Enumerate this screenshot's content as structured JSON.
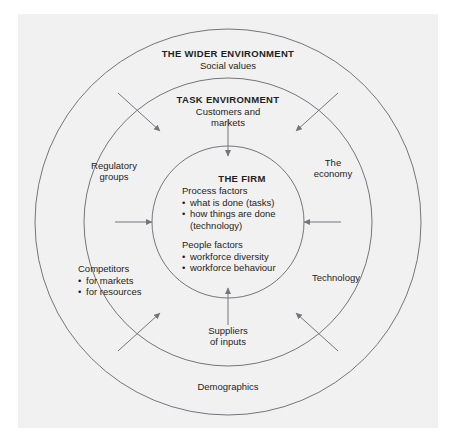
{
  "page": {
    "cropped_header_text": "ORGANISATIONS AND BEHAVIOUR",
    "background_color": "#ffffff",
    "panel_color": "#f1f1f2",
    "line_color": "#6d6e71",
    "text_color": "#231f20"
  },
  "diagram": {
    "type": "concentric-circles",
    "center": {
      "x": 228,
      "y": 222
    },
    "rings": [
      {
        "name": "wider-environment",
        "radius": 193
      },
      {
        "name": "task-environment",
        "radius": 144
      },
      {
        "name": "the-firm",
        "radius": 76
      }
    ],
    "outer_ring": {
      "title": "THE WIDER ENVIRONMENT",
      "subtitle": "Social values",
      "labels": [
        {
          "name": "the-economy",
          "text_line1": "The",
          "text_line2": "economy"
        },
        {
          "name": "technology",
          "text_line1": "Technology",
          "text_line2": ""
        },
        {
          "name": "demographics",
          "text_line1": "Demographics",
          "text_line2": ""
        }
      ]
    },
    "middle_ring": {
      "title": "TASK ENVIRONMENT",
      "subtitle_line1": "Customers and",
      "subtitle_line2": "markets",
      "labels": [
        {
          "name": "regulatory-groups",
          "text_line1": "Regulatory",
          "text_line2": "groups"
        },
        {
          "name": "suppliers-of-inputs",
          "text_line1": "Suppliers",
          "text_line2": "of inputs"
        }
      ],
      "competitors": {
        "heading": "Competitors",
        "items": [
          "for markets",
          "for resources"
        ]
      }
    },
    "core": {
      "title": "THE FIRM",
      "groups": [
        {
          "heading": "Process factors",
          "items": [
            "what is done (tasks)",
            "how things are done"
          ],
          "continuation": "(technology)"
        },
        {
          "heading": "People factors",
          "items": [
            "workforce diversity",
            "workforce behaviour"
          ],
          "continuation": ""
        }
      ]
    },
    "arrows": [
      {
        "name": "arrow-outer-top-left",
        "direction": "inward-diagonal"
      },
      {
        "name": "arrow-outer-top-right",
        "direction": "inward-diagonal"
      },
      {
        "name": "arrow-outer-bottom-left",
        "direction": "inward-diagonal"
      },
      {
        "name": "arrow-outer-bottom-right",
        "direction": "inward-diagonal"
      },
      {
        "name": "arrow-inner-top",
        "direction": "inward-vertical"
      },
      {
        "name": "arrow-inner-bottom",
        "direction": "inward-vertical"
      },
      {
        "name": "arrow-inner-left",
        "direction": "inward-horizontal"
      },
      {
        "name": "arrow-inner-right",
        "direction": "inward-horizontal"
      }
    ]
  }
}
